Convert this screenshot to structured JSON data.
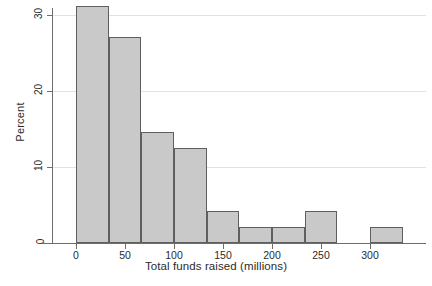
{
  "chart_data": {
    "type": "bar",
    "title": "",
    "xlabel": "Total funds raised (millions)",
    "ylabel": "Percent",
    "xlim": [
      -10,
      330
    ],
    "ylim": [
      0,
      32
    ],
    "grid": true,
    "legend": null,
    "bin_width": 33.3,
    "xticks": [
      0,
      50,
      100,
      150,
      200,
      250,
      300
    ],
    "xtick_labels": [
      "0",
      "50",
      "100",
      "150",
      "200",
      "250",
      "300"
    ],
    "yticks": [
      0,
      10,
      20,
      30
    ],
    "ytick_labels": [
      "0",
      "10",
      "20",
      "30"
    ],
    "bin_edges": [
      0,
      33.3,
      66.7,
      100,
      133.3,
      166.7,
      200,
      233.3,
      266.7,
      300,
      333.3
    ],
    "bins": [
      {
        "left": 0,
        "right": 33.3,
        "value": 31.2
      },
      {
        "left": 33.3,
        "right": 66.7,
        "value": 27.1
      },
      {
        "left": 66.7,
        "right": 100,
        "value": 14.6
      },
      {
        "left": 100,
        "right": 133.3,
        "value": 12.5
      },
      {
        "left": 133.3,
        "right": 166.7,
        "value": 4.2
      },
      {
        "left": 166.7,
        "right": 200,
        "value": 2.1
      },
      {
        "left": 200,
        "right": 233.3,
        "value": 2.1
      },
      {
        "left": 233.3,
        "right": 266.7,
        "value": 4.2
      },
      {
        "left": 300,
        "right": 333.3,
        "value": 2.1
      }
    ],
    "categories": [
      "0-33",
      "33-67",
      "67-100",
      "100-133",
      "133-167",
      "167-200",
      "200-233",
      "233-267",
      "300-333"
    ],
    "values": [
      31.2,
      27.1,
      14.6,
      12.5,
      4.2,
      2.1,
      2.1,
      4.2,
      2.1
    ],
    "colors": {
      "bar_fill": "#c9c9c9",
      "bar_edge": "#5f5f5f",
      "grid": "#e2e2e2",
      "axis": "#6d6d6d",
      "text": "#2b2b2b",
      "background": "#ffffff"
    }
  }
}
